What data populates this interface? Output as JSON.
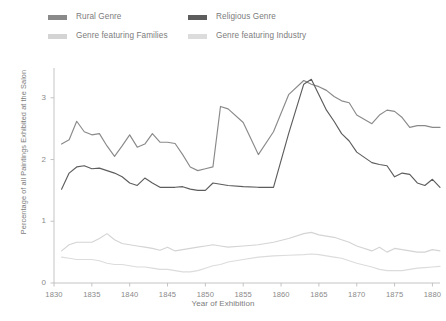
{
  "chart_data": {
    "type": "line",
    "title": "",
    "xlabel": "Year of Exhibition",
    "ylabel": "Percentage of all Paintings Exhibited at the Salon",
    "xlim": [
      1830,
      1881
    ],
    "ylim": [
      0,
      3.45
    ],
    "xticks": [
      1830,
      1835,
      1840,
      1845,
      1850,
      1855,
      1860,
      1865,
      1870,
      1875,
      1880
    ],
    "yticks": [
      0,
      1,
      2,
      3
    ],
    "xtick_labels": [
      "1830",
      "1835",
      "1840",
      "1845",
      "1850",
      "1855",
      "1860",
      "1865",
      "1870",
      "1875",
      "1880"
    ],
    "ytick_labels": [
      "0",
      "1",
      "2",
      "3"
    ],
    "grid": false,
    "legend_position": "top-left",
    "x": [
      1831,
      1832,
      1833,
      1834,
      1835,
      1836,
      1837,
      1838,
      1839,
      1840,
      1841,
      1842,
      1843,
      1844,
      1845,
      1846,
      1847,
      1848,
      1849,
      1850,
      1851,
      1852,
      1853,
      1855,
      1857,
      1859,
      1861,
      1863,
      1864,
      1865,
      1866,
      1867,
      1868,
      1869,
      1870,
      1872,
      1873,
      1874,
      1875,
      1876,
      1877,
      1878,
      1879,
      1880,
      1881
    ],
    "series": [
      {
        "name": "Rural Genre",
        "color": "#8a8a8a",
        "values": [
          2.25,
          2.32,
          2.62,
          2.45,
          2.4,
          2.42,
          2.22,
          2.05,
          2.22,
          2.4,
          2.2,
          2.25,
          2.42,
          2.28,
          2.28,
          2.26,
          2.08,
          1.88,
          1.82,
          1.85,
          1.88,
          2.86,
          2.82,
          2.6,
          2.08,
          2.45,
          3.05,
          3.28,
          3.22,
          3.18,
          3.12,
          3.02,
          2.95,
          2.92,
          2.72,
          2.58,
          2.72,
          2.8,
          2.78,
          2.68,
          2.52,
          2.55,
          2.55,
          2.52,
          2.52
        ]
      },
      {
        "name": "Religious Genre",
        "color": "#5d5d5d",
        "values": [
          1.52,
          1.78,
          1.88,
          1.9,
          1.85,
          1.86,
          1.82,
          1.78,
          1.72,
          1.62,
          1.58,
          1.7,
          1.62,
          1.55,
          1.55,
          1.55,
          1.56,
          1.52,
          1.5,
          1.5,
          1.62,
          1.6,
          1.58,
          1.56,
          1.55,
          1.55,
          2.42,
          3.22,
          3.3,
          3.05,
          2.8,
          2.62,
          2.42,
          2.3,
          2.12,
          1.95,
          1.92,
          1.9,
          1.72,
          1.78,
          1.76,
          1.62,
          1.58,
          1.68,
          1.55
        ]
      },
      {
        "name": "Genre featuring Families",
        "color": "#d4d4d4",
        "values": [
          0.52,
          0.62,
          0.66,
          0.66,
          0.66,
          0.72,
          0.8,
          0.7,
          0.64,
          0.62,
          0.6,
          0.58,
          0.56,
          0.53,
          0.58,
          0.52,
          0.54,
          0.56,
          0.58,
          0.6,
          0.62,
          0.6,
          0.58,
          0.6,
          0.62,
          0.66,
          0.72,
          0.8,
          0.82,
          0.78,
          0.76,
          0.74,
          0.7,
          0.66,
          0.6,
          0.52,
          0.58,
          0.5,
          0.56,
          0.54,
          0.52,
          0.5,
          0.5,
          0.54,
          0.52
        ]
      },
      {
        "name": "Genre featuring Industry",
        "color": "#dcdcdc",
        "values": [
          0.42,
          0.4,
          0.38,
          0.38,
          0.38,
          0.36,
          0.32,
          0.3,
          0.3,
          0.28,
          0.26,
          0.26,
          0.24,
          0.22,
          0.22,
          0.2,
          0.18,
          0.18,
          0.2,
          0.24,
          0.28,
          0.3,
          0.34,
          0.38,
          0.42,
          0.44,
          0.45,
          0.46,
          0.47,
          0.46,
          0.44,
          0.42,
          0.4,
          0.36,
          0.32,
          0.26,
          0.22,
          0.2,
          0.2,
          0.2,
          0.22,
          0.24,
          0.25,
          0.26,
          0.27
        ]
      }
    ]
  },
  "legend": {
    "items": [
      {
        "label": "Rural Genre",
        "color": "#8a8a8a"
      },
      {
        "label": "Religious Genre",
        "color": "#5d5d5d"
      },
      {
        "label": "Genre featuring Families",
        "color": "#d4d4d4"
      },
      {
        "label": "Genre featuring Industry",
        "color": "#dcdcdc"
      }
    ]
  },
  "axes": {
    "x_title": "Year of Exhibition",
    "y_title": "Percentage of all Paintings Exhibited at the Salon"
  },
  "colors": {
    "axis_line": "#bdbdbd",
    "tick_text": "#8a8a8a",
    "label_text": "#7c7c7c",
    "background": "#ffffff"
  }
}
